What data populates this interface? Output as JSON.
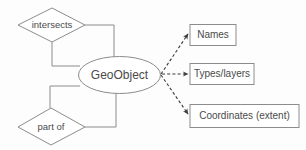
{
  "diagram": {
    "type": "entity-relationship",
    "colors": {
      "background": "#fdfdfd",
      "shape_fill": "#ffffff",
      "shape_stroke": "#8c8c8c",
      "connector": "#8c8c8c",
      "dashed_connector": "#3d3d3d",
      "text": "#4a4a4a"
    },
    "entity": {
      "label": "GeoObject",
      "shape": "ellipse"
    },
    "relationships": [
      {
        "label": "intersects",
        "shape": "diamond",
        "position": "top-left"
      },
      {
        "label": "part of",
        "shape": "diamond",
        "position": "bottom-left"
      }
    ],
    "attributes": [
      {
        "label": "Names",
        "shape": "rectangle",
        "link": "dashed-arrow"
      },
      {
        "label": "Types/layers",
        "shape": "rectangle",
        "link": "dashed-arrow"
      },
      {
        "label": "Coordinates (extent)",
        "shape": "rectangle",
        "link": "dashed-arrow"
      }
    ]
  }
}
